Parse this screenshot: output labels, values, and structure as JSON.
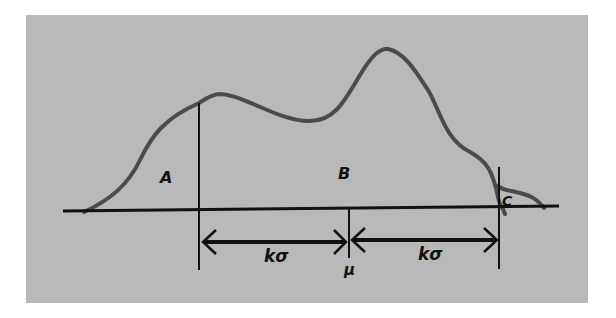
{
  "figure": {
    "colors": {
      "background": "#ffffff",
      "panel": "#b9b9b9",
      "curve": "#4b4b4b",
      "lines": "#111111"
    }
  },
  "labels": {
    "region_a": "A",
    "region_b": "B",
    "region_c": "C",
    "mean": "μ",
    "left_interval": "kσ",
    "right_interval": "kσ"
  }
}
